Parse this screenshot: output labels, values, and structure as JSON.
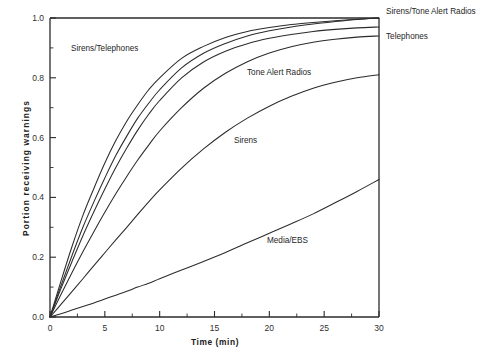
{
  "chart_data": {
    "type": "line",
    "title": "",
    "xlabel": "Time (min)",
    "ylabel": "Portion receiving warnings",
    "xlim": [
      0,
      30
    ],
    "ylim": [
      0.0,
      1.0
    ],
    "xticks": [
      0,
      5,
      10,
      15,
      20,
      25,
      30
    ],
    "xticklabels": [
      "0",
      "5",
      "10",
      "15",
      "20",
      "25",
      "30"
    ],
    "yticks": [
      0.0,
      0.2,
      0.4,
      0.6,
      0.8,
      1.0
    ],
    "yticklabels": [
      "0.0",
      "0.2",
      "0.4",
      "0.6",
      "0.8",
      "1.0"
    ],
    "grid": false,
    "legend_position": "inline-annotations",
    "x": [
      0,
      1,
      2,
      3,
      4,
      5,
      6,
      7,
      8,
      9,
      10,
      12,
      14,
      16,
      18,
      20,
      22,
      24,
      26,
      28,
      30
    ],
    "series": [
      {
        "name": "Sirens/Telephones",
        "values": [
          0.0,
          0.12,
          0.235,
          0.34,
          0.43,
          0.515,
          0.59,
          0.655,
          0.71,
          0.76,
          0.8,
          0.865,
          0.905,
          0.935,
          0.955,
          0.968,
          0.978,
          0.985,
          0.991,
          0.996,
          1.0
        ]
      },
      {
        "name": "Sirens/Tone Alert Radios",
        "values": [
          0.0,
          0.105,
          0.205,
          0.3,
          0.385,
          0.465,
          0.54,
          0.605,
          0.665,
          0.715,
          0.76,
          0.833,
          0.882,
          0.915,
          0.94,
          0.957,
          0.97,
          0.98,
          0.988,
          0.995,
          1.0
        ]
      },
      {
        "name": "Telephones",
        "values": [
          0.0,
          0.095,
          0.185,
          0.272,
          0.352,
          0.428,
          0.5,
          0.565,
          0.625,
          0.678,
          0.724,
          0.8,
          0.853,
          0.889,
          0.914,
          0.932,
          0.945,
          0.955,
          0.962,
          0.967,
          0.97
        ]
      },
      {
        "name": "Tone Alert Radios",
        "values": [
          0.0,
          0.075,
          0.148,
          0.218,
          0.285,
          0.35,
          0.412,
          0.47,
          0.525,
          0.575,
          0.622,
          0.7,
          0.765,
          0.815,
          0.854,
          0.883,
          0.904,
          0.919,
          0.929,
          0.936,
          0.94
        ]
      },
      {
        "name": "Sirens",
        "values": [
          0.0,
          0.042,
          0.085,
          0.128,
          0.172,
          0.215,
          0.258,
          0.3,
          0.343,
          0.385,
          0.425,
          0.498,
          0.562,
          0.618,
          0.665,
          0.705,
          0.738,
          0.765,
          0.785,
          0.8,
          0.81
        ]
      },
      {
        "name": "Media/EBS",
        "values": [
          0.0,
          0.011,
          0.023,
          0.035,
          0.047,
          0.06,
          0.073,
          0.086,
          0.1,
          0.113,
          0.128,
          0.157,
          0.186,
          0.216,
          0.248,
          0.28,
          0.312,
          0.345,
          0.382,
          0.42,
          0.46
        ]
      }
    ],
    "annotations": [
      {
        "text": "Sirens/Telephones",
        "x_px": 71,
        "y_px": 51,
        "anchor": "start"
      },
      {
        "text": "Tone Alert Radios",
        "x_px": 247,
        "y_px": 75,
        "anchor": "start"
      },
      {
        "text": "Sirens",
        "x_px": 234,
        "y_px": 143,
        "anchor": "start"
      },
      {
        "text": "Media/EBS",
        "x_px": 267,
        "y_px": 243,
        "anchor": "start"
      },
      {
        "text": "Sirens/Tone Alert Radios",
        "x_px": 386,
        "y_px": 14,
        "anchor": "start"
      },
      {
        "text": "Telephones",
        "x_px": 386,
        "y_px": 39,
        "anchor": "start"
      }
    ],
    "colors": {
      "line": "#2b2b2b",
      "axis": "#2b2b2b",
      "background": "#ffffff"
    }
  }
}
